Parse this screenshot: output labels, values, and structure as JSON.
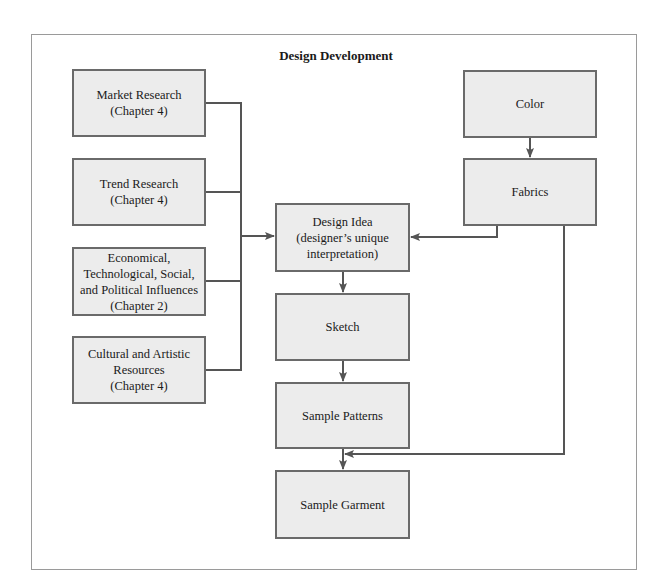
{
  "diagram": {
    "title": "Design Development",
    "nodes": {
      "market_research": "Market Research\n(Chapter 4)",
      "trend_research": "Trend Research\n(Chapter 4)",
      "influences": "Economical,\nTechnological, Social,\nand Political Influences\n(Chapter 2)",
      "cultural": "Cultural and Artistic\nResources\n(Chapter 4)",
      "design_idea": "Design Idea\n(designer’s unique\ninterpretation)",
      "sketch": "Sketch",
      "sample_patterns": "Sample Patterns",
      "sample_garment": "Sample Garment",
      "color": "Color",
      "fabrics": "Fabrics"
    },
    "edges": [
      {
        "from": "market_research",
        "to": "design_idea"
      },
      {
        "from": "trend_research",
        "to": "design_idea"
      },
      {
        "from": "influences",
        "to": "design_idea"
      },
      {
        "from": "cultural",
        "to": "design_idea"
      },
      {
        "from": "color",
        "to": "fabrics"
      },
      {
        "from": "fabrics",
        "to": "design_idea"
      },
      {
        "from": "design_idea",
        "to": "sketch"
      },
      {
        "from": "sketch",
        "to": "sample_patterns"
      },
      {
        "from": "sample_patterns",
        "to": "sample_garment"
      },
      {
        "from": "fabrics",
        "to": "sample_garment"
      }
    ],
    "colors": {
      "box_fill": "#ececec",
      "box_border": "#6a6a6a",
      "line": "#555555"
    }
  }
}
